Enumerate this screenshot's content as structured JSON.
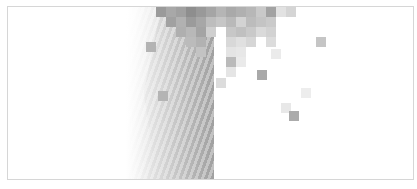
{
  "canvas": {
    "width": 417,
    "height": 189,
    "frame_border_color": "#d6d6d6",
    "background": "#ffffff"
  },
  "gradient_region": {
    "description": "diagonal striped gray gradient fading from white to mid-gray, sharply cut at right edge",
    "start_color": "#ffffff",
    "end_color": "#a0a0a0"
  },
  "pixel_blocks": [
    {
      "x": 155,
      "y": 0,
      "c": "#9a9a9a"
    },
    {
      "x": 165,
      "y": 0,
      "c": "#a8a8a8"
    },
    {
      "x": 175,
      "y": 0,
      "c": "#a0a0a0"
    },
    {
      "x": 185,
      "y": 0,
      "c": "#8e8e8e"
    },
    {
      "x": 195,
      "y": 0,
      "c": "#999999"
    },
    {
      "x": 205,
      "y": 0,
      "c": "#a5a5a5"
    },
    {
      "x": 215,
      "y": 0,
      "c": "#b5b5b5"
    },
    {
      "x": 225,
      "y": 0,
      "c": "#a9a9a9"
    },
    {
      "x": 235,
      "y": 0,
      "c": "#b0b0b0"
    },
    {
      "x": 245,
      "y": 0,
      "c": "#b7b7b7"
    },
    {
      "x": 255,
      "y": 0,
      "c": "#c9c9c9"
    },
    {
      "x": 265,
      "y": 0,
      "c": "#a2a2a2"
    },
    {
      "x": 275,
      "y": 0,
      "c": "#e2e2e2"
    },
    {
      "x": 285,
      "y": 0,
      "c": "#d5d5d5"
    },
    {
      "x": 165,
      "y": 10,
      "c": "#a1a1a1"
    },
    {
      "x": 175,
      "y": 10,
      "c": "#b1b1b1"
    },
    {
      "x": 185,
      "y": 10,
      "c": "#9b9b9b"
    },
    {
      "x": 195,
      "y": 10,
      "c": "#a7a7a7"
    },
    {
      "x": 205,
      "y": 10,
      "c": "#bdbdbd"
    },
    {
      "x": 215,
      "y": 10,
      "c": "#c6c6c6"
    },
    {
      "x": 225,
      "y": 10,
      "c": "#b9b9b9"
    },
    {
      "x": 235,
      "y": 10,
      "c": "#d3d3d3"
    },
    {
      "x": 245,
      "y": 10,
      "c": "#bcbcbc"
    },
    {
      "x": 255,
      "y": 10,
      "c": "#c4c4c4"
    },
    {
      "x": 265,
      "y": 10,
      "c": "#cacaca"
    },
    {
      "x": 175,
      "y": 20,
      "c": "#afafaf"
    },
    {
      "x": 185,
      "y": 20,
      "c": "#b8b8b8"
    },
    {
      "x": 195,
      "y": 20,
      "c": "#a4a4a4"
    },
    {
      "x": 205,
      "y": 20,
      "c": "#cfcfcf"
    },
    {
      "x": 225,
      "y": 20,
      "c": "#c7c7c7"
    },
    {
      "x": 235,
      "y": 20,
      "c": "#c0c0c0"
    },
    {
      "x": 245,
      "y": 20,
      "c": "#c9c9c9"
    },
    {
      "x": 255,
      "y": 20,
      "c": "#dadada"
    },
    {
      "x": 265,
      "y": 20,
      "c": "#d2d2d2"
    },
    {
      "x": 185,
      "y": 30,
      "c": "#bbbbbb"
    },
    {
      "x": 195,
      "y": 30,
      "c": "#b2b2b2"
    },
    {
      "x": 225,
      "y": 30,
      "c": "#d8d8d8"
    },
    {
      "x": 235,
      "y": 30,
      "c": "#e0e0e0"
    },
    {
      "x": 245,
      "y": 30,
      "c": "#d6d6d6"
    },
    {
      "x": 265,
      "y": 30,
      "c": "#dcdcdc"
    },
    {
      "x": 315,
      "y": 30,
      "c": "#c5c5c5"
    },
    {
      "x": 145,
      "y": 35,
      "c": "#b3b3b3"
    },
    {
      "x": 195,
      "y": 40,
      "c": "#c3c3c3"
    },
    {
      "x": 225,
      "y": 40,
      "c": "#e4e4e4"
    },
    {
      "x": 235,
      "y": 40,
      "c": "#e7e7e7"
    },
    {
      "x": 270,
      "y": 42,
      "c": "#ebebeb"
    },
    {
      "x": 225,
      "y": 50,
      "c": "#bababa"
    },
    {
      "x": 235,
      "y": 50,
      "c": "#eaeaea"
    },
    {
      "x": 225,
      "y": 60,
      "c": "#e5e5e5"
    },
    {
      "x": 256,
      "y": 63,
      "c": "#a9a9a9"
    },
    {
      "x": 215,
      "y": 71,
      "c": "#dcdcdc"
    },
    {
      "x": 300,
      "y": 81,
      "c": "#ededed"
    },
    {
      "x": 157,
      "y": 84,
      "c": "#b4b4b4"
    },
    {
      "x": 280,
      "y": 96,
      "c": "#e8e8e8"
    },
    {
      "x": 288,
      "y": 104,
      "c": "#ababab"
    }
  ]
}
